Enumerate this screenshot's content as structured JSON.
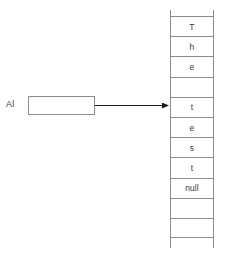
{
  "diagram": {
    "reference": {
      "label": "Al",
      "box_value": "",
      "box_name": "reference-box"
    },
    "arrow": {
      "name": "reference-arrow",
      "points_to_index": 4,
      "color": "#1a1a1a"
    },
    "array": {
      "name": "character-array",
      "cells": [
        {
          "value": "T",
          "index": 0
        },
        {
          "value": "h",
          "index": 1
        },
        {
          "value": "e",
          "index": 2
        },
        {
          "value": "",
          "index": 3
        },
        {
          "value": "t",
          "index": 4
        },
        {
          "value": "e",
          "index": 5
        },
        {
          "value": "s",
          "index": 6
        },
        {
          "value": "t",
          "index": 7
        },
        {
          "value": "null",
          "index": 8
        },
        {
          "value": "",
          "index": 9
        },
        {
          "value": "",
          "index": 10
        }
      ]
    },
    "colors": {
      "stroke": "#8d8d8d",
      "text": "#3a3a3a",
      "arrow": "#1a1a1a",
      "background": "#ffffff"
    }
  }
}
